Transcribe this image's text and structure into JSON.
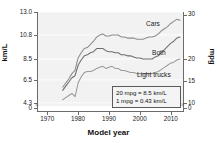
{
  "chart_data": {
    "type": "line",
    "title": "",
    "xlabel": "Model year",
    "ylabel": "km/L",
    "ylabel_right": "mpg",
    "xlim": [
      1967,
      2014
    ],
    "ylim": [
      4.0,
      13.0
    ],
    "ylim_right": [
      9.3,
      30.2
    ],
    "grid": true,
    "legend_position": "inline-annotations",
    "xticks": [
      "1970",
      "1980",
      "1990",
      "2000",
      "2010"
    ],
    "xtick_values": [
      1970,
      1980,
      1990,
      2000,
      2010
    ],
    "yticks_left": [
      "13.0",
      "10.8",
      "8.5",
      "6.5",
      "4.3",
      "0"
    ],
    "ytick_values_left": [
      13.0,
      10.8,
      8.5,
      6.5,
      4.3,
      0
    ],
    "yticks_right": [
      "35",
      "30",
      "20",
      "15",
      "10",
      "0"
    ],
    "ytick_values_right": [
      35,
      30,
      20,
      15,
      10,
      0
    ],
    "annotations": [
      "20 mpg = 8.5 km/L",
      "1 mpg = 0.43 km/L"
    ],
    "series": [
      {
        "name": "Cars",
        "color": "#8c8c8c",
        "x": [
          1975,
          1976,
          1977,
          1978,
          1979,
          1980,
          1981,
          1982,
          1983,
          1984,
          1985,
          1986,
          1987,
          1988,
          1989,
          1990,
          1991,
          1992,
          1993,
          1994,
          1995,
          1996,
          1997,
          1998,
          1999,
          2000,
          2001,
          2002,
          2003,
          2004,
          2005,
          2006,
          2007,
          2008,
          2009,
          2010,
          2011,
          2012,
          2013
        ],
        "values": [
          5.8,
          6.2,
          6.6,
          7.1,
          7.4,
          8.6,
          9.1,
          9.5,
          9.6,
          9.9,
          10.2,
          10.6,
          10.8,
          10.9,
          10.7,
          10.7,
          10.8,
          10.8,
          10.8,
          10.6,
          10.6,
          10.5,
          10.5,
          10.5,
          10.4,
          10.4,
          10.4,
          10.5,
          10.6,
          10.6,
          10.7,
          10.9,
          11.2,
          11.4,
          11.6,
          11.9,
          12.1,
          12.3,
          12.2
        ]
      },
      {
        "name": "Both",
        "color": "#6e6e6e",
        "x": [
          1975,
          1976,
          1977,
          1978,
          1979,
          1980,
          1981,
          1982,
          1983,
          1984,
          1985,
          1986,
          1987,
          1988,
          1989,
          1990,
          1991,
          1992,
          1993,
          1994,
          1995,
          1996,
          1997,
          1998,
          1999,
          2000,
          2001,
          2002,
          2003,
          2004,
          2005,
          2006,
          2007,
          2008,
          2009,
          2010,
          2011,
          2012,
          2013
        ],
        "values": [
          5.5,
          5.9,
          6.3,
          6.7,
          6.9,
          7.9,
          8.4,
          8.8,
          8.9,
          9.1,
          9.2,
          9.5,
          9.5,
          9.5,
          9.3,
          9.2,
          9.2,
          9.1,
          9.1,
          8.9,
          8.9,
          8.8,
          8.8,
          8.7,
          8.6,
          8.6,
          8.5,
          8.5,
          8.5,
          8.5,
          8.7,
          8.8,
          9.1,
          9.4,
          9.7,
          10.0,
          10.2,
          10.5,
          10.6
        ]
      },
      {
        "name": "Light trucks",
        "color": "#9a9a9a",
        "x": [
          1975,
          1976,
          1977,
          1978,
          1979,
          1980,
          1981,
          1982,
          1983,
          1984,
          1985,
          1986,
          1987,
          1988,
          1989,
          1990,
          1991,
          1992,
          1993,
          1994,
          1995,
          1996,
          1997,
          1998,
          1999,
          2000,
          2001,
          2002,
          2003,
          2004,
          2005,
          2006,
          2007,
          2008,
          2009,
          2010,
          2011,
          2012,
          2013
        ],
        "values": [
          4.6,
          4.8,
          5.0,
          5.2,
          4.9,
          6.2,
          6.8,
          7.2,
          7.3,
          7.3,
          7.4,
          7.6,
          7.7,
          7.8,
          7.6,
          7.7,
          7.8,
          7.6,
          7.6,
          7.4,
          7.4,
          7.3,
          7.2,
          7.2,
          7.1,
          7.1,
          7.1,
          7.1,
          7.1,
          7.1,
          7.2,
          7.3,
          7.5,
          7.7,
          7.9,
          8.1,
          8.2,
          8.4,
          8.5
        ]
      }
    ]
  },
  "axis_break_glyph": "≈"
}
